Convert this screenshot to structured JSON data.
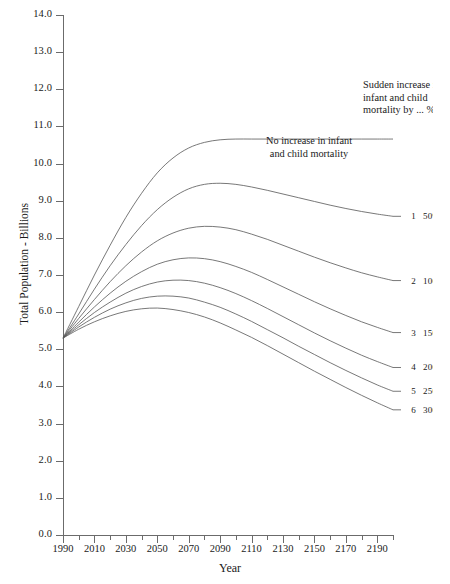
{
  "chart_data": {
    "type": "line",
    "title": "",
    "xlabel": "Year",
    "ylabel": "Total Population - Billions",
    "xlim": [
      1990,
      2200
    ],
    "ylim": [
      0.0,
      14.0
    ],
    "grid": false,
    "legend_position": "right-inline",
    "x_ticks": [
      1990,
      2010,
      2030,
      2050,
      2070,
      2090,
      2110,
      2130,
      2150,
      2170,
      2190
    ],
    "x_tick_labels": [
      "1990",
      "2010",
      "2030",
      "2050",
      "2070",
      "2090",
      "2110",
      "2130",
      "2150",
      "2170",
      "2190"
    ],
    "x_minor_step": 10,
    "y_ticks": [
      0.0,
      1.0,
      2.0,
      3.0,
      4.0,
      5.0,
      6.0,
      7.0,
      8.0,
      9.0,
      10.0,
      11.0,
      12.0,
      13.0,
      14.0
    ],
    "y_tick_labels": [
      "0.0",
      "1.0",
      "2.0",
      "3.0",
      "4.0",
      "5.0",
      "6.0",
      "7.0",
      "8.0",
      "9.0",
      "10.0",
      "11.0",
      "12.0",
      "13.0",
      "14.0"
    ],
    "x": [
      1990,
      2000,
      2010,
      2020,
      2030,
      2040,
      2050,
      2060,
      2070,
      2080,
      2090,
      2100,
      2110,
      2120,
      2130,
      2140,
      2150,
      2160,
      2170,
      2180,
      2190,
      2200
    ],
    "series": [
      {
        "name": "No increase in infant and child mortality",
        "label_number": "",
        "label_pct": "",
        "values": [
          5.3,
          6.15,
          7.0,
          7.8,
          8.55,
          9.2,
          9.75,
          10.15,
          10.42,
          10.57,
          10.64,
          10.66,
          10.66,
          10.66,
          10.66,
          10.66,
          10.66,
          10.66,
          10.66,
          10.66,
          10.66,
          10.66
        ]
      },
      {
        "name": "Sudden increase in infant and child mortality by 50%",
        "label_number": "1",
        "label_pct": "50%",
        "values": [
          5.3,
          5.95,
          6.62,
          7.25,
          7.82,
          8.33,
          8.76,
          9.09,
          9.32,
          9.44,
          9.47,
          9.44,
          9.37,
          9.28,
          9.18,
          9.08,
          8.98,
          8.88,
          8.79,
          8.71,
          8.64,
          8.58
        ]
      },
      {
        "name": "Sudden increase in infant and child mortality by 100%",
        "label_number": "2",
        "label_pct": "100%",
        "values": [
          5.3,
          5.83,
          6.34,
          6.82,
          7.25,
          7.62,
          7.92,
          8.13,
          8.26,
          8.31,
          8.29,
          8.22,
          8.1,
          7.96,
          7.8,
          7.64,
          7.48,
          7.33,
          7.19,
          7.06,
          6.95,
          6.85
        ]
      },
      {
        "name": "Sudden increase in infant and child mortality by 150%",
        "label_number": "3",
        "label_pct": "150%",
        "values": [
          5.3,
          5.73,
          6.14,
          6.51,
          6.83,
          7.09,
          7.29,
          7.41,
          7.46,
          7.44,
          7.36,
          7.23,
          7.07,
          6.88,
          6.68,
          6.48,
          6.28,
          6.09,
          5.91,
          5.74,
          5.59,
          5.45
        ]
      },
      {
        "name": "Sudden increase in infant and child mortality by 200%",
        "label_number": "4",
        "label_pct": "200%",
        "values": [
          5.3,
          5.66,
          5.99,
          6.27,
          6.51,
          6.69,
          6.81,
          6.86,
          6.85,
          6.78,
          6.66,
          6.5,
          6.31,
          6.1,
          5.88,
          5.66,
          5.44,
          5.23,
          5.03,
          4.84,
          4.67,
          4.51
        ]
      },
      {
        "name": "Sudden increase in infant and child mortality by 250%",
        "label_number": "5",
        "label_pct": "250%",
        "values": [
          5.3,
          5.6,
          5.86,
          6.08,
          6.25,
          6.37,
          6.43,
          6.43,
          6.38,
          6.27,
          6.13,
          5.95,
          5.75,
          5.53,
          5.31,
          5.08,
          4.86,
          4.64,
          4.43,
          4.23,
          4.04,
          3.87
        ]
      },
      {
        "name": "Sudden increase in infant and child mortality by 300%",
        "label_number": "6",
        "label_pct": "300%",
        "values": [
          5.3,
          5.54,
          5.74,
          5.9,
          6.02,
          6.09,
          6.11,
          6.07,
          5.99,
          5.87,
          5.71,
          5.52,
          5.32,
          5.1,
          4.87,
          4.64,
          4.41,
          4.19,
          3.97,
          3.76,
          3.56,
          3.37
        ]
      }
    ],
    "annotations": [
      {
        "id": "sudden",
        "lines": [
          "Sudden increase in",
          "infant and child",
          "mortality by ... %"
        ],
        "clipped": true
      },
      {
        "id": "no-increase",
        "lines": [
          "No increase in infant",
          "and child mortality"
        ],
        "clipped": false
      }
    ]
  },
  "axes": {
    "y_title": "Total Population - Billions",
    "x_title": "Year"
  },
  "colors": {
    "curve": "#555555",
    "axis": "#6b6b6b",
    "text": "#1a1a1a",
    "background": "#ffffff"
  }
}
